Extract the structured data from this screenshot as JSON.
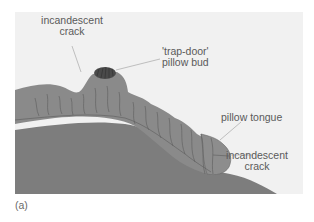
{
  "figure": {
    "panel_label": "(a)",
    "background_color": "#f1f1f1",
    "colors": {
      "substrate": "#7d7d7d",
      "lava_flow": "#8a8a8a",
      "crack_lines": "#5c5c5c",
      "pillow_bud": "#4a4a4a",
      "leader_lines": "#a8a8a8",
      "label_text": "#5a5a5a"
    }
  },
  "annotations": {
    "incandescent_crack_top": {
      "line1": "incandescent",
      "line2": "crack"
    },
    "trap_door_pillow_bud": {
      "line1": "'trap-door'",
      "line2": "pillow bud"
    },
    "pillow_tongue": {
      "line1": "pillow tongue"
    },
    "incandescent_crack_right": {
      "line1": "incandescent",
      "line2": "crack"
    }
  }
}
